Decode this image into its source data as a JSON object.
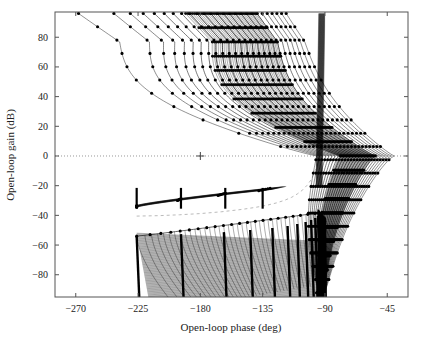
{
  "chart_data": {
    "type": "line",
    "title": "",
    "subtitle": "",
    "xlabel": "Open-loop phase (deg)",
    "ylabel": "Open-loop gain (dB)",
    "xlim": [
      -285,
      -30
    ],
    "ylim": [
      -95,
      97
    ],
    "xticks": [
      -270,
      -225,
      -180,
      -135,
      -90,
      -45
    ],
    "xticklabels": [
      "−270",
      "−225",
      "−180",
      "−135",
      "−90",
      "−45"
    ],
    "yticks": [
      80,
      60,
      40,
      20,
      0,
      -20,
      -40,
      -60,
      -80
    ],
    "yticklabels": [
      "80",
      "60",
      "40",
      "20",
      "0",
      "−20",
      "−40",
      "−60",
      "−80"
    ],
    "grid": false,
    "legend": null,
    "legend_position": "none",
    "marker": "filled-circle",
    "line_color": "#000000",
    "marker_color": "#000000",
    "background_color": "#ffffff",
    "frame_color": "#555555",
    "zero_db_line": {
      "value": 0,
      "style": "dotted",
      "color": "#999999",
      "label": "0 dB reference"
    },
    "critical_point": {
      "x": -180,
      "y": 0,
      "marker": "plus",
      "color": "#444444",
      "label": "critical point (−180 deg, 0 dB)"
    },
    "dashed_reference_curve": {
      "style": "dashed",
      "color": "#bbbbbb",
      "points": [
        [
          -226,
          -40.5
        ],
        [
          -210,
          -40.2
        ],
        [
          -195,
          -39.6
        ],
        [
          -180,
          -38.8
        ],
        [
          -165,
          -37.6
        ],
        [
          -150,
          -36.0
        ],
        [
          -140,
          -34.6
        ],
        [
          -132,
          -33.2
        ],
        [
          -125,
          -31.6
        ],
        [
          -119,
          -29.8
        ],
        [
          -114,
          -27.8
        ],
        [
          -110,
          -25.6
        ],
        [
          -106,
          -22.8
        ],
        [
          -103,
          -19.8
        ],
        [
          -100,
          -16.0
        ],
        [
          -98,
          -12.0
        ],
        [
          -96,
          -7.0
        ],
        [
          -95,
          -2.0
        ],
        [
          -94,
          3.0
        ]
      ]
    },
    "series_description": "Family of Nichols (open-loop gain vs phase) response curves for a swept parameter set. Upper family sweeps from high gain at top down through 0 dB crossing; lower family forms a dense near-vertical band descending below -40 dB toward -90 deg.",
    "upper_family": {
      "count": 26,
      "description": "Curves entering at top near 95 dB, bending left to a phase minimum, then sweeping right and crossing 0 dB between -95 and -40 deg.",
      "phase_at_top_range": [
        -268,
        -118
      ],
      "phase_at_zero_db_range": [
        -96,
        -40
      ],
      "min_gain_bottom_range": [
        -30,
        -95
      ]
    },
    "mid_family": {
      "count": 12,
      "description": "Short shallow segments spanning -226 to -130 deg between -36 and -22 dB, rising to join the right-hand bulge.",
      "gain_range": [
        -36,
        -20
      ],
      "phase_range": [
        -226,
        -128
      ]
    },
    "lower_family": {
      "count": 40,
      "description": "Dense hatched band of near-vertical curves from about -54 dB down past -95 dB, spanning -226 deg to -90 deg and converging at -90 deg.",
      "gain_range": [
        -95,
        -52
      ],
      "phase_range": [
        -226,
        -90
      ]
    },
    "data_points_per_curve": 22,
    "axis_ranges_note": "Phase axis in degrees, gain axis in decibels."
  },
  "figure": {
    "xlabel": "Open-loop phase (deg)",
    "ylabel": "Open-loop gain (dB)"
  }
}
